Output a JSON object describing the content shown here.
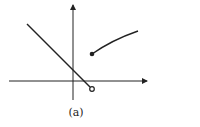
{
  "figure": {
    "caption": "(a)",
    "axes": {
      "x_axis": true,
      "y_axis": true,
      "arrows": true
    },
    "pieces": [
      {
        "type": "line",
        "direction": "decreasing",
        "start": "extends upper-left",
        "end": "open circle below x-axis"
      },
      {
        "type": "curve",
        "direction": "increasing, concave down",
        "start": "closed dot above x-axis",
        "end": "extends upper-right"
      }
    ],
    "colors": {
      "stroke": "#222222",
      "background": "#ffffff"
    }
  }
}
